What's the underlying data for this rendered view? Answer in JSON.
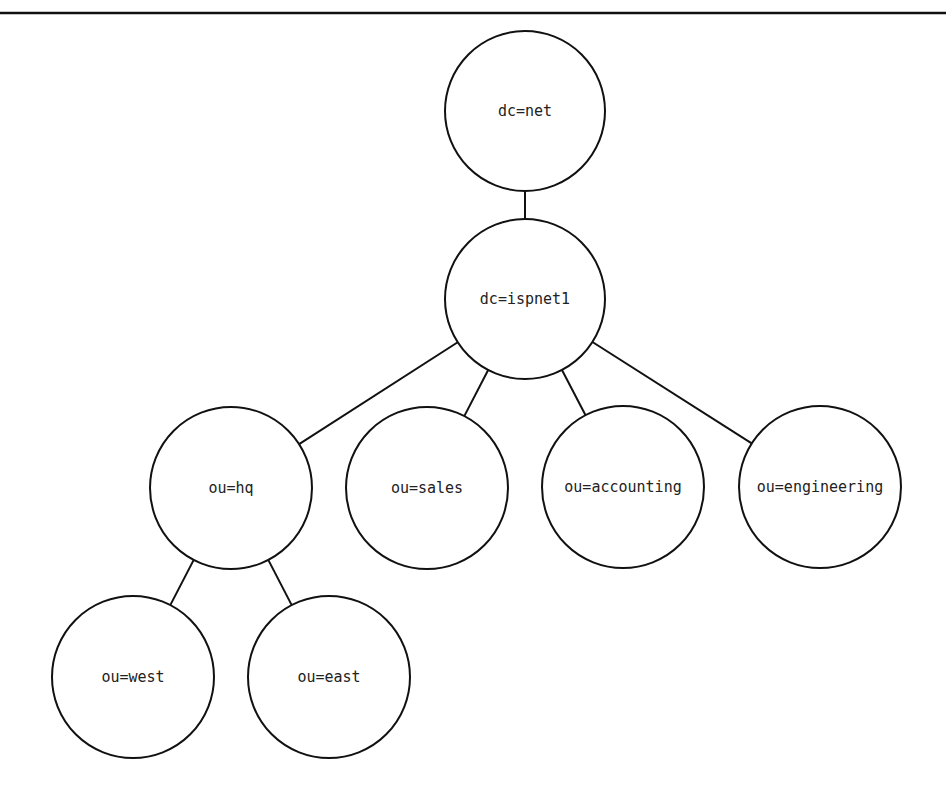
{
  "diagram": {
    "type": "tree",
    "colors": {
      "stroke": "#111111",
      "text": "#222222",
      "background": "#ffffff"
    },
    "nodes": [
      {
        "id": "net",
        "label": "dc=net",
        "cx": 525,
        "cy": 111,
        "r": 80
      },
      {
        "id": "ispnet1",
        "label": "dc=ispnet1",
        "cx": 525,
        "cy": 299,
        "r": 80
      },
      {
        "id": "hq",
        "label": "ou=hq",
        "cx": 231,
        "cy": 488,
        "r": 81
      },
      {
        "id": "sales",
        "label": "ou=sales",
        "cx": 427,
        "cy": 488,
        "r": 81
      },
      {
        "id": "accounting",
        "label": "ou=accounting",
        "cx": 623,
        "cy": 487,
        "r": 81
      },
      {
        "id": "engineering",
        "label": "ou=engineering",
        "cx": 820,
        "cy": 487,
        "r": 81
      },
      {
        "id": "west",
        "label": "ou=west",
        "cx": 133,
        "cy": 677,
        "r": 81
      },
      {
        "id": "east",
        "label": "ou=east",
        "cx": 329,
        "cy": 677,
        "r": 81
      }
    ],
    "edges": [
      {
        "from": "net",
        "to": "ispnet1"
      },
      {
        "from": "ispnet1",
        "to": "hq"
      },
      {
        "from": "ispnet1",
        "to": "sales"
      },
      {
        "from": "ispnet1",
        "to": "accounting"
      },
      {
        "from": "ispnet1",
        "to": "engineering"
      },
      {
        "from": "hq",
        "to": "west"
      },
      {
        "from": "hq",
        "to": "east"
      }
    ]
  },
  "labels": {
    "net": "dc=net",
    "ispnet1": "dc=ispnet1",
    "hq": "ou=hq",
    "sales": "ou=sales",
    "accounting": "ou=accounting",
    "engineering": "ou=engineering",
    "west": "ou=west",
    "east": "ou=east"
  }
}
